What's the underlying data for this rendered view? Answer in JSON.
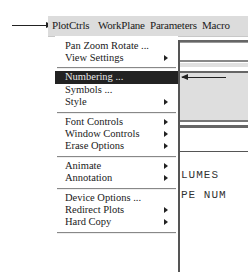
{
  "menubar": {
    "items": [
      {
        "label": "PlotCtrls",
        "mnemonic": "C",
        "active": true
      },
      {
        "label": "WorkPlane",
        "mnemonic": "W"
      },
      {
        "label": "Parameters",
        "mnemonic": "r"
      },
      {
        "label": "Macro",
        "mnemonic": "M"
      }
    ]
  },
  "dropdown": {
    "items": [
      {
        "label": "Pan Zoom Rotate ...",
        "submenu": false
      },
      {
        "label": "View Settings",
        "submenu": true
      },
      {
        "label": "Numbering ...",
        "submenu": false,
        "highlighted": true
      },
      {
        "label": "Symbols ...",
        "submenu": false
      },
      {
        "label": "Style",
        "submenu": true
      },
      {
        "label": "Font Controls",
        "submenu": true
      },
      {
        "label": "Window Controls",
        "submenu": true
      },
      {
        "label": "Erase Options",
        "submenu": true
      },
      {
        "label": "Animate",
        "submenu": true
      },
      {
        "label": "Annotation",
        "submenu": true
      },
      {
        "label": "Device Options ...",
        "submenu": false
      },
      {
        "label": "Redirect Plots",
        "submenu": true
      },
      {
        "label": "Hard Copy",
        "submenu": true
      }
    ]
  },
  "main_window": {
    "text_lines": [
      "LUMES",
      "PE NUM"
    ]
  },
  "annotations": {
    "arrow_to_menu": "arrow pointing to PlotCtrls",
    "arrow_to_item": "arrow pointing to Numbering ..."
  },
  "colors": {
    "menubar_bg": "#dcdcdc",
    "highlight_bg": "#222222",
    "highlight_fg": "#e8e8e8"
  }
}
